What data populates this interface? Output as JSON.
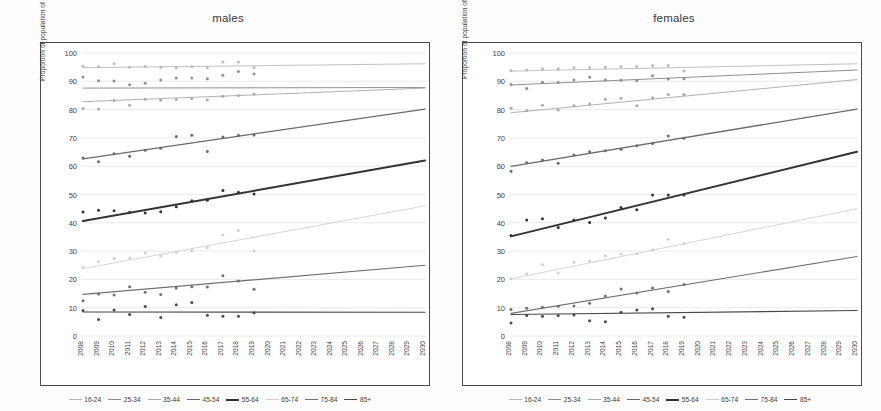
{
  "figure": {
    "panels": [
      {
        "key": "males",
        "title": "males"
      },
      {
        "key": "females",
        "title": "females"
      }
    ],
    "ylabel": "Proportion of population of given age group (%)"
  },
  "legend": {
    "items": [
      {
        "label": "16-24",
        "color": "#b9b9b9",
        "width": 0.9
      },
      {
        "label": "25-34",
        "color": "#8f8f8f",
        "width": 1.0
      },
      {
        "label": "35-44",
        "color": "#a8a8a8",
        "width": 0.9
      },
      {
        "label": "45-54",
        "color": "#6a6a6a",
        "width": 1.3
      },
      {
        "label": "55-64",
        "color": "#333333",
        "width": 2.0
      },
      {
        "label": "65-74",
        "color": "#cfcfcf",
        "width": 0.9
      },
      {
        "label": "75-84",
        "color": "#707070",
        "width": 1.1
      },
      {
        "label": "85+",
        "color": "#4a4a4a",
        "width": 1.1
      }
    ]
  },
  "chart_data": [
    {
      "type": "scatter",
      "title": "males",
      "xlabel": "",
      "ylabel": "Proportion of population of given age group (%)",
      "xlim": [
        2008,
        2030
      ],
      "ylim": [
        0,
        100
      ],
      "ytick_labels": [
        "0",
        "10",
        "20",
        "30",
        "40",
        "50",
        "60",
        "70",
        "80",
        "90",
        "100"
      ],
      "yticks": [
        0,
        10,
        20,
        30,
        40,
        50,
        60,
        70,
        80,
        90,
        100
      ],
      "x": [
        2008,
        2009,
        2010,
        2011,
        2012,
        2013,
        2014,
        2015,
        2016,
        2017,
        2018,
        2019,
        2020,
        2021,
        2022,
        2023,
        2024,
        2025,
        2026,
        2027,
        2028,
        2029,
        2030
      ],
      "xtick_labels": [
        "2008",
        "2009",
        "2010",
        "2011",
        "2012",
        "2013",
        "2014",
        "2015",
        "2016",
        "2017",
        "2018",
        "2019",
        "2020",
        "2021",
        "2022",
        "2023",
        "2024",
        "2025",
        "2026",
        "2027",
        "2028",
        "2029",
        "2030"
      ],
      "grid": true,
      "legend_position": "bottom",
      "series": [
        {
          "name": "16-24",
          "color": "#b9b9b9",
          "width": 0.9,
          "observed_years": [
            2008,
            2009,
            2010,
            2011,
            2012,
            2013,
            2014,
            2015,
            2016,
            2017,
            2018,
            2019
          ],
          "observed_values": [
            95.3,
            95.1,
            96.2,
            95.0,
            95.2,
            95.0,
            94.7,
            95.1,
            94.9,
            96.8,
            96.8,
            94.9
          ],
          "trend": [
            94.8,
            96.2
          ]
        },
        {
          "name": "25-34",
          "color": "#8f8f8f",
          "width": 1.0,
          "observed_years": [
            2008,
            2009,
            2010,
            2011,
            2012,
            2013,
            2014,
            2015,
            2016,
            2017,
            2018,
            2019
          ],
          "observed_values": [
            91.5,
            90.2,
            90.1,
            88.8,
            89.3,
            90.5,
            91.2,
            91.2,
            90.9,
            92.1,
            93.5,
            92.6
          ],
          "trend": [
            87.6,
            87.8
          ]
        },
        {
          "name": "35-44",
          "color": "#a8a8a8",
          "width": 0.9,
          "observed_years": [
            2008,
            2009,
            2010,
            2011,
            2012,
            2013,
            2014,
            2015,
            2016,
            2017,
            2018,
            2019
          ],
          "observed_values": [
            80.4,
            80.2,
            83.2,
            81.5,
            83.7,
            83.3,
            83.6,
            83.9,
            83.4,
            84.7,
            85.0,
            85.5
          ],
          "trend": [
            82.8,
            87.6
          ]
        },
        {
          "name": "45-54",
          "color": "#6a6a6a",
          "width": 1.3,
          "observed_years": [
            2008,
            2009,
            2010,
            2011,
            2012,
            2013,
            2014,
            2015,
            2016,
            2017,
            2018,
            2019
          ],
          "observed_values": [
            62.9,
            61.6,
            64.4,
            63.5,
            65.6,
            66.3,
            70.5,
            70.9,
            65.2,
            70.3,
            70.9,
            71.0
          ],
          "trend": [
            62.6,
            80.2
          ]
        },
        {
          "name": "55-64",
          "color": "#333333",
          "width": 2.0,
          "observed_years": [
            2008,
            2009,
            2010,
            2011,
            2012,
            2013,
            2014,
            2015,
            2016,
            2017,
            2018,
            2019
          ],
          "observed_values": [
            43.8,
            44.4,
            44.3,
            43.7,
            43.5,
            43.9,
            45.7,
            47.8,
            48.0,
            51.4,
            50.8,
            50.2
          ],
          "trend": [
            40.6,
            62.0
          ]
        },
        {
          "name": "65-74",
          "color": "#cfcfcf",
          "width": 0.9,
          "observed_years": [
            2008,
            2009,
            2010,
            2011,
            2012,
            2013,
            2014,
            2015,
            2016,
            2017,
            2018,
            2019
          ],
          "observed_values": [
            24.4,
            26.2,
            27.4,
            27.6,
            29.3,
            28.3,
            29.5,
            30.2,
            31.3,
            35.7,
            37.3,
            30.0
          ],
          "trend": [
            23.8,
            46.0
          ]
        },
        {
          "name": "75-84",
          "color": "#707070",
          "width": 1.1,
          "observed_years": [
            2008,
            2009,
            2010,
            2011,
            2012,
            2013,
            2014,
            2015,
            2016,
            2017,
            2018,
            2019
          ],
          "observed_values": [
            12.5,
            14.8,
            14.5,
            17.4,
            15.5,
            14.7,
            17.0,
            17.4,
            17.3,
            21.3,
            19.4,
            16.5
          ],
          "trend": [
            14.7,
            25.0
          ]
        },
        {
          "name": "85+",
          "color": "#4a4a4a",
          "width": 1.1,
          "observed_years": [
            2008,
            2009,
            2010,
            2011,
            2012,
            2013,
            2014,
            2015,
            2016,
            2017,
            2018,
            2019
          ],
          "observed_values": [
            9.0,
            5.8,
            9.2,
            7.6,
            10.4,
            6.5,
            11.0,
            11.8,
            7.3,
            7.0,
            7.0,
            8.2
          ],
          "trend": [
            8.5,
            8.4
          ]
        }
      ]
    },
    {
      "type": "scatter",
      "title": "females",
      "xlabel": "",
      "ylabel": "Proportion of population of given age group (%)",
      "xlim": [
        2008,
        2030
      ],
      "ylim": [
        0,
        100
      ],
      "ytick_labels": [
        "0",
        "10",
        "20",
        "30",
        "40",
        "50",
        "60",
        "70",
        "80",
        "90",
        "100"
      ],
      "yticks": [
        0,
        10,
        20,
        30,
        40,
        50,
        60,
        70,
        80,
        90,
        100
      ],
      "x": [
        2008,
        2009,
        2010,
        2011,
        2012,
        2013,
        2014,
        2015,
        2016,
        2017,
        2018,
        2019,
        2020,
        2021,
        2022,
        2023,
        2024,
        2025,
        2026,
        2027,
        2028,
        2029,
        2030
      ],
      "xtick_labels": [
        "2008",
        "2009",
        "2010",
        "2011",
        "2012",
        "2013",
        "2014",
        "2015",
        "2016",
        "2017",
        "2018",
        "2019",
        "2020",
        "2021",
        "2022",
        "2023",
        "2024",
        "2025",
        "2026",
        "2027",
        "2028",
        "2029",
        "2030"
      ],
      "grid": true,
      "legend_position": "bottom",
      "series": [
        {
          "name": "16-24",
          "color": "#b9b9b9",
          "width": 0.9,
          "observed_years": [
            2008,
            2009,
            2010,
            2011,
            2012,
            2013,
            2014,
            2015,
            2016,
            2017,
            2018,
            2019
          ],
          "observed_values": [
            93.8,
            94.0,
            94.4,
            94.4,
            94.8,
            94.9,
            95.0,
            95.2,
            95.2,
            95.6,
            95.6,
            93.6
          ],
          "trend": [
            93.6,
            96.2
          ]
        },
        {
          "name": "25-34",
          "color": "#8f8f8f",
          "width": 1.0,
          "observed_years": [
            2008,
            2009,
            2010,
            2011,
            2012,
            2013,
            2014,
            2015,
            2016,
            2017,
            2018,
            2019
          ],
          "observed_values": [
            88.9,
            87.5,
            89.7,
            89.6,
            90.5,
            91.4,
            90.5,
            90.4,
            90.2,
            92.0,
            90.8,
            90.9
          ],
          "trend": [
            88.7,
            94.0
          ]
        },
        {
          "name": "35-44",
          "color": "#a8a8a8",
          "width": 0.9,
          "observed_years": [
            2008,
            2009,
            2010,
            2011,
            2012,
            2013,
            2014,
            2015,
            2016,
            2017,
            2018,
            2019
          ],
          "observed_values": [
            80.5,
            79.6,
            81.5,
            79.9,
            81.4,
            82.0,
            83.7,
            84.0,
            81.4,
            84.2,
            85.3,
            85.3
          ],
          "trend": [
            78.9,
            90.6
          ]
        },
        {
          "name": "45-54",
          "color": "#6a6a6a",
          "width": 1.3,
          "observed_years": [
            2008,
            2009,
            2010,
            2011,
            2012,
            2013,
            2014,
            2015,
            2016,
            2017,
            2018,
            2019
          ],
          "observed_values": [
            58.2,
            61.2,
            62.2,
            61.0,
            64.0,
            65.1,
            65.5,
            66.0,
            67.2,
            68.0,
            70.7,
            69.9
          ],
          "trend": [
            59.9,
            80.2
          ]
        },
        {
          "name": "55-64",
          "color": "#333333",
          "width": 2.0,
          "observed_years": [
            2008,
            2009,
            2010,
            2011,
            2012,
            2013,
            2014,
            2015,
            2016,
            2017,
            2018,
            2019
          ],
          "observed_values": [
            35.5,
            41.0,
            41.4,
            38.3,
            41.0,
            40.1,
            41.7,
            45.4,
            44.6,
            49.8,
            49.8,
            49.8
          ],
          "trend": [
            35.2,
            65.1
          ]
        },
        {
          "name": "65-74",
          "color": "#cfcfcf",
          "width": 0.9,
          "observed_years": [
            2008,
            2009,
            2010,
            2011,
            2012,
            2013,
            2014,
            2015,
            2016,
            2017,
            2018,
            2019
          ],
          "observed_values": [
            20.2,
            22.0,
            25.2,
            22.3,
            26.1,
            26.4,
            28.4,
            29.0,
            29.0,
            30.5,
            34.2,
            32.6
          ],
          "trend": [
            20.2,
            45.0
          ]
        },
        {
          "name": "75-84",
          "color": "#707070",
          "width": 1.1,
          "observed_years": [
            2008,
            2009,
            2010,
            2011,
            2012,
            2013,
            2014,
            2015,
            2016,
            2017,
            2018,
            2019
          ],
          "observed_values": [
            9.4,
            9.8,
            10.2,
            10.5,
            10.6,
            11.6,
            14.1,
            16.6,
            15.2,
            17.0,
            15.7,
            18.2
          ],
          "trend": [
            8.0,
            28.1
          ]
        },
        {
          "name": "85+",
          "color": "#4a4a4a",
          "width": 1.1,
          "observed_years": [
            2008,
            2009,
            2010,
            2011,
            2012,
            2013,
            2014,
            2015,
            2016,
            2017,
            2018,
            2019
          ],
          "observed_values": [
            4.6,
            7.2,
            7.0,
            7.2,
            7.4,
            5.4,
            5.0,
            8.4,
            9.2,
            9.6,
            7.0,
            6.6
          ],
          "trend": [
            7.6,
            9.0
          ]
        }
      ]
    }
  ]
}
